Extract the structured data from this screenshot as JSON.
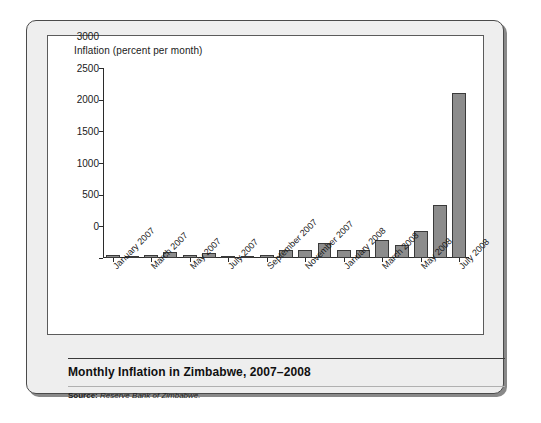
{
  "figure": {
    "axis_title": "Inflation (percent per month)",
    "title": "Monthly Inflation in Zimbabwe, 2007–2008",
    "source_label": "Source:",
    "source_text": "Reserve Bank of Zimbabwe."
  },
  "colors": {
    "bar_fill": "#8c8c8c",
    "bar_stroke": "#3a3a3a",
    "axis": "#2b2b2b",
    "panel_bg": "#eeeeee",
    "chart_bg": "#ffffff",
    "panel_border": "#4a4a4a"
  },
  "chart_data": {
    "type": "bar",
    "title": "Monthly Inflation in Zimbabwe, 2007–2008",
    "xlabel": "",
    "ylabel": "Inflation (percent per month)",
    "ylim": [
      0,
      3000
    ],
    "yticks": [
      0,
      500,
      1000,
      1500,
      2000,
      2500,
      3000
    ],
    "ytick_labels": [
      "0",
      "500",
      "1000",
      "1500",
      "2000",
      "2500",
      "3000"
    ],
    "grid": false,
    "legend": false,
    "categories": [
      "January 2007",
      "February 2007",
      "March 2007",
      "April 2007",
      "May 2007",
      "June 2007",
      "July 2007",
      "August 2007",
      "September 2007",
      "October 2007",
      "November 2007",
      "December 2007",
      "January 2008",
      "February 2008",
      "March 2008",
      "April 2008",
      "May 2008",
      "June 2008",
      "July 2008"
    ],
    "xtick_labels": [
      "January 2007",
      "March 2007",
      "May 2007",
      "July 2007",
      "September 2007",
      "November 2007",
      "January 2008",
      "March 2008",
      "May 2008",
      "July 2008"
    ],
    "xtick_indices": [
      0,
      2,
      4,
      6,
      8,
      10,
      12,
      14,
      16,
      18
    ],
    "values": [
      50,
      35,
      50,
      100,
      50,
      85,
      30,
      12,
      40,
      120,
      120,
      230,
      120,
      130,
      280,
      210,
      430,
      840,
      2600
    ]
  }
}
